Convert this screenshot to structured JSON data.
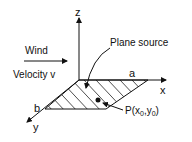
{
  "labels": {
    "z_axis": "z",
    "x_axis": "x",
    "y_axis": "y",
    "a": "a",
    "b": "b",
    "wind": "Wind",
    "velocity": "Velocity v",
    "plane_source": "Plane source",
    "point_p": "P(x",
    "point_x_sub": "0",
    "point_comma": ",y",
    "point_y_sub": "0",
    "point_close": ")"
  }
}
